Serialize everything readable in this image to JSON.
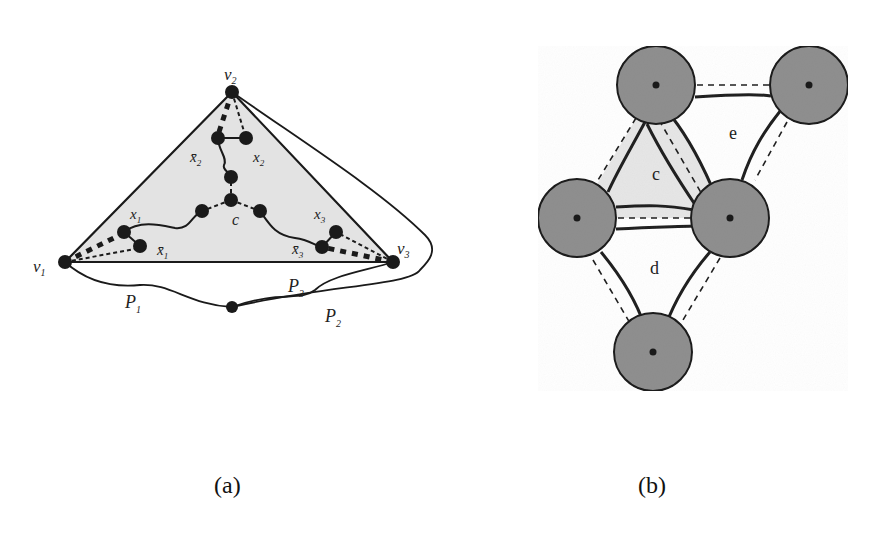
{
  "figure": {
    "panel_a": {
      "caption": "(a)",
      "vertex_labels": {
        "v1": "v",
        "v1_sub": "1",
        "v2": "v",
        "v2_sub": "2",
        "v3": "v",
        "v3_sub": "3",
        "c": "c",
        "x1": "x",
        "x1_sub": "1",
        "x1bar": "x̄",
        "x1bar_sub": "1",
        "x2": "x",
        "x2_sub": "2",
        "x2bar": "x̄",
        "x2bar_sub": "2",
        "x3": "x",
        "x3_sub": "3",
        "x3bar": "x̄",
        "x3bar_sub": "3"
      },
      "path_labels": {
        "p1": "P",
        "p1_sub": "1",
        "p2": "P",
        "p2_sub": "2",
        "p3": "P",
        "p3_sub": "3"
      }
    },
    "panel_b": {
      "caption": "(b)",
      "face_labels": {
        "c": "c",
        "d": "d",
        "e": "e"
      }
    }
  },
  "colors": {
    "ink": "#1a1a1a",
    "triangle_fill": "#e3e3e3",
    "disk_fill": "#8f8f8f",
    "face_c_fill": "#e6e6e6"
  }
}
